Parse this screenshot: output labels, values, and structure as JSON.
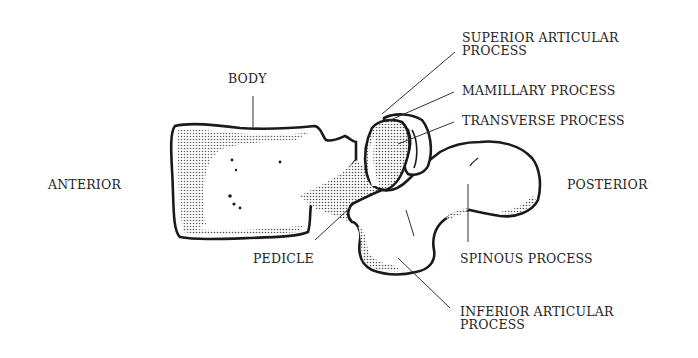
{
  "diagram": {
    "labels": {
      "superior_articular_line1": "SUPERIOR ARTICULAR",
      "superior_articular_line2": "PROCESS",
      "mamillary": "MAMILLARY PROCESS",
      "transverse": "TRANSVERSE PROCESS",
      "body": "BODY",
      "anterior": "ANTERIOR",
      "posterior": "POSTERIOR",
      "pedicle": "PEDICLE",
      "spinous": "SPINOUS PROCESS",
      "inferior_articular_line1": "INFERIOR ARTICULAR",
      "inferior_articular_line2": "PROCESS"
    },
    "colors": {
      "background": "#ffffff",
      "outline": "#1a1a1a",
      "stipple": "#555555",
      "text": "#1e1e1e"
    }
  }
}
